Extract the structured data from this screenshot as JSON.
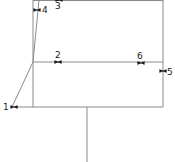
{
  "diagram": {
    "width": 175,
    "height": 162,
    "line_color": "#8a8a8a",
    "marker_color": "#1a1a1a",
    "lines": [
      {
        "id": "left-vertical",
        "x1": 33,
        "y1": 0,
        "x2": 33,
        "y2": 107
      },
      {
        "id": "right-vertical",
        "x1": 163,
        "y1": 0,
        "x2": 163,
        "y2": 107
      },
      {
        "id": "top-edge",
        "x1": 33,
        "y1": 0.5,
        "x2": 163,
        "y2": 0.5
      },
      {
        "id": "middle-horizontal",
        "x1": 33,
        "y1": 62,
        "x2": 163,
        "y2": 62
      },
      {
        "id": "bottom-horizontal",
        "x1": 14,
        "y1": 107,
        "x2": 163,
        "y2": 107
      },
      {
        "id": "stem",
        "x1": 87,
        "y1": 107,
        "x2": 87,
        "y2": 162
      },
      {
        "id": "diagonal-lower",
        "x1": 33,
        "y1": 62,
        "x2": 12,
        "y2": 107
      },
      {
        "id": "diagonal-upper",
        "x1": 33,
        "y1": 62,
        "x2": 39,
        "y2": 0
      }
    ],
    "markers": [
      {
        "label": "1",
        "x": 14,
        "y": 107,
        "orient": "h",
        "label_x": 3,
        "label_y": 110
      },
      {
        "label": "2",
        "x": 58,
        "y": 62,
        "orient": "h",
        "label_x": 55,
        "label_y": 58
      },
      {
        "label": "3",
        "x": 59,
        "y": 0,
        "orient": "h",
        "label_x": 55,
        "label_y": 9
      },
      {
        "label": "4",
        "x": 37,
        "y": 10,
        "orient": "h",
        "label_x": 42,
        "label_y": 13
      },
      {
        "label": "5",
        "x": 163,
        "y": 71,
        "orient": "h",
        "label_x": 167,
        "label_y": 75
      },
      {
        "label": "6",
        "x": 141,
        "y": 63,
        "orient": "h",
        "label_x": 137,
        "label_y": 59
      }
    ]
  }
}
